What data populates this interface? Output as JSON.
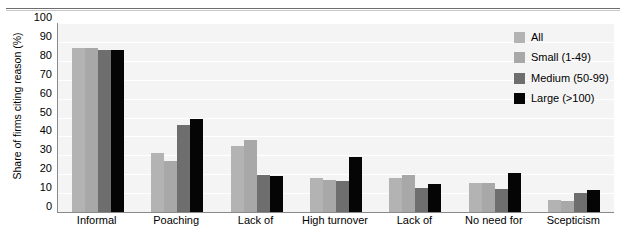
{
  "chart_data": {
    "type": "bar",
    "title": "",
    "xlabel": "",
    "ylabel": "Share of firms citing reason (%)",
    "ylim": [
      0,
      100
    ],
    "ytick_step": 10,
    "yticks": [
      "0",
      "10",
      "20",
      "30",
      "40",
      "50",
      "60",
      "70",
      "80",
      "90",
      "100"
    ],
    "grid": "horizontal",
    "legend_position": "top-right",
    "categories": [
      "Informal",
      "Poaching",
      "Lack of",
      "High turnover",
      "Lack of",
      "No need for",
      "Scepticism"
    ],
    "series": [
      {
        "name": "All",
        "color": "#b3b3b3",
        "values": [
          87,
          31,
          35,
          18,
          18,
          15.5,
          6.5
        ]
      },
      {
        "name": "Small (1-49)",
        "color": "#a8a8a8",
        "values": [
          87,
          27,
          38,
          17,
          19.5,
          15.5,
          6
        ]
      },
      {
        "name": "Medium (50-99)",
        "color": "#6e6e6e",
        "values": [
          85.5,
          46,
          19.5,
          16.5,
          12.5,
          12,
          10
        ]
      },
      {
        "name": "Large (>100)",
        "color": "#050505",
        "values": [
          85.5,
          49,
          19,
          29,
          15,
          20.5,
          11.5
        ]
      }
    ]
  },
  "legend": {
    "items": [
      {
        "label": "All",
        "color": "#b3b3b3"
      },
      {
        "label": "Small (1-49)",
        "color": "#a8a8a8"
      },
      {
        "label": "Medium (50-99)",
        "color": "#6e6e6e"
      },
      {
        "label": "Large (>100)",
        "color": "#050505"
      }
    ]
  },
  "axis": {
    "y_title": "Share of firms citing reason (%)"
  },
  "colors": {
    "plot_background": "#f4f4f4",
    "gridline": "#ffffff",
    "axis_line": "#8a8a8a",
    "text": "#000000"
  }
}
